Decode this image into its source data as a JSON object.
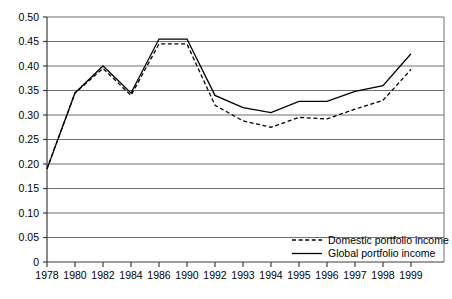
{
  "chart_data": {
    "type": "line",
    "title": "",
    "subtitle": "",
    "xlabel": "",
    "ylabel": "",
    "grid": true,
    "legend_position": "bottom-right",
    "ylim": [
      0,
      0.5
    ],
    "ytick_labels": [
      "0.50",
      "0.45",
      "0.40",
      "0.35",
      "0.30",
      "0.25",
      "0.20",
      "0.15",
      "0.10",
      "0.05",
      "0"
    ],
    "ytick_values": [
      0.5,
      0.45,
      0.4,
      0.35,
      0.3,
      0.25,
      0.2,
      0.15,
      0.1,
      0.05,
      0
    ],
    "categories": [
      "1978",
      "1980",
      "1982",
      "1984",
      "1986",
      "1990",
      "1992",
      "1993",
      "1994",
      "1995",
      "1996",
      "1997",
      "1998",
      "1999"
    ],
    "series": [
      {
        "name": "Domestic portfolio income",
        "style": "dashed",
        "color": "#000000",
        "values": [
          0.19,
          0.345,
          0.395,
          0.34,
          0.445,
          0.445,
          0.32,
          0.288,
          0.275,
          0.295,
          0.292,
          0.312,
          0.33,
          0.393
        ]
      },
      {
        "name": "Global portfolio income",
        "style": "solid",
        "color": "#000000",
        "values": [
          0.19,
          0.345,
          0.4,
          0.345,
          0.455,
          0.455,
          0.34,
          0.315,
          0.305,
          0.328,
          0.328,
          0.348,
          0.36,
          0.425
        ]
      }
    ],
    "legend": [
      {
        "label": "Domestic portfolio income",
        "style": "dashed"
      },
      {
        "label": "Global portfolio income",
        "style": "solid"
      }
    ]
  },
  "colors": {
    "gridline": "#6e6e6e",
    "axis": "#3c3c3c",
    "line": "#000000",
    "background": "#ffffff"
  }
}
